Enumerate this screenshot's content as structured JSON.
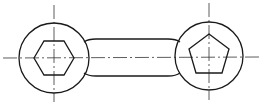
{
  "drawing": {
    "type": "technical-drawing",
    "subject": "double-ended wrench / connecting link with hexagonal and pentagonal sockets",
    "colors": {
      "background": "#ffffff",
      "outline": "#1a1a1a",
      "centerline": "#333333"
    },
    "left_head": {
      "shape": "circle",
      "cx": 54,
      "cy": 58,
      "r": 35,
      "socket": "hexagon",
      "socket_points": "34,58 44,41 64,41 74,58 64,75 44,75"
    },
    "right_head": {
      "shape": "circle",
      "cx": 209,
      "cy": 56,
      "r": 34,
      "socket": "pentagon",
      "socket_points": "209,34 229,49 222,73 196,73 189,49"
    },
    "bar": {
      "top_path": "M 84 42 Q 88 39 96 39 L 168 39 Q 176 39 180 42",
      "bottom_path": "M 84 73 Q 88 76 96 76 L 168 76 Q 176 76 180 73"
    },
    "centerlines": {
      "horizontal": {
        "x1": 3,
        "y1": 58,
        "x2": 262,
        "y2": 57
      },
      "left_vertical": {
        "x1": 54,
        "y1": 5,
        "x2": 54,
        "y2": 102
      },
      "right_vertical": {
        "x1": 209,
        "y1": 3,
        "x2": 209,
        "y2": 100
      }
    }
  }
}
